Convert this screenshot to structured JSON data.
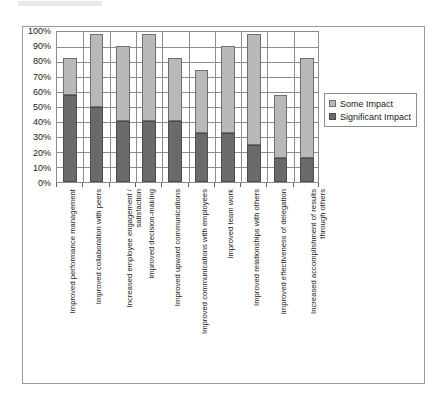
{
  "chart_data": {
    "type": "bar",
    "subtype": "stacked-bar",
    "title": "",
    "xlabel": "",
    "ylabel": "",
    "ylim": [
      0,
      100
    ],
    "ytick_labels": [
      "100%",
      "90%",
      "80%",
      "70%",
      "60%",
      "50%",
      "40%",
      "30%",
      "20%",
      "10%",
      "0%"
    ],
    "ytick_values": [
      100,
      90,
      80,
      70,
      60,
      50,
      40,
      30,
      20,
      10,
      0
    ],
    "grid": true,
    "legend_position": "right",
    "categories": [
      "Improved performance management",
      "Improved collaboration with peers",
      "Increased employee engagement / satisfaction",
      "Improved decision-making",
      "Improved upward communications",
      "Improved communications with employees",
      "Improved team work",
      "Improved relationships with others",
      "Improved effectiveness of delegation",
      "Increased accomplishment of results through others"
    ],
    "category_lines": [
      [
        "Improved performance management"
      ],
      [
        "Improved collaboration with peers"
      ],
      [
        "Increased employee engagement /",
        "satisfaction"
      ],
      [
        "Improved decision-making"
      ],
      [
        "Improved upward communications"
      ],
      [
        "Improved communications with employees"
      ],
      [
        "Improved team work"
      ],
      [
        "Improved relationships with others"
      ],
      [
        "Improved effectiveness of delegation"
      ],
      [
        "Increased accomplishment of results",
        "through others"
      ]
    ],
    "series": [
      {
        "name": "Significant Impact",
        "color": "#6a6a6a",
        "values": [
          58,
          50,
          41,
          41,
          41,
          33,
          33,
          25,
          16,
          16
        ]
      },
      {
        "name": "Some Impact",
        "color": "#b9b9b9",
        "values": [
          25,
          49,
          50,
          58,
          42,
          42,
          58,
          74,
          42,
          67
        ]
      }
    ],
    "totals": [
      83,
      99,
      91,
      99,
      83,
      75,
      91,
      99,
      58,
      83
    ]
  },
  "legend": {
    "items": [
      {
        "label": "Some Impact",
        "color": "#b9b9b9",
        "swatch": "some-impact-swatch"
      },
      {
        "label": "Significant Impact",
        "color": "#6a6a6a",
        "swatch": "significant-impact-swatch"
      }
    ]
  }
}
